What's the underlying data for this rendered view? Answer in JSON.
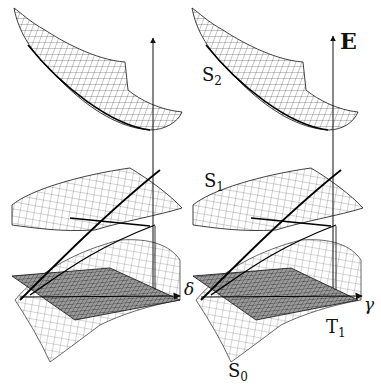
{
  "figure": {
    "panels": [
      {
        "name": "left",
        "labels_shown": false
      },
      {
        "name": "right",
        "labels_shown": true
      }
    ],
    "labels": {
      "E": "E",
      "S2_main": "S",
      "S2_sub": "2",
      "S1_main": "S",
      "S1_sub": "1",
      "T1_main": "T",
      "T1_sub": "1",
      "S0_main": "S",
      "S0_sub": "0",
      "gamma": "γ",
      "delta": "δ"
    },
    "surfaces": [
      "S2 (upper bowl)",
      "S1 (middle saddle)",
      "T1 (dark plane)",
      "S0 (lower curved sheet)"
    ],
    "colors": {
      "line": "#111111",
      "plane_fill": "#8a8a8a",
      "background": "#ffffff"
    }
  }
}
